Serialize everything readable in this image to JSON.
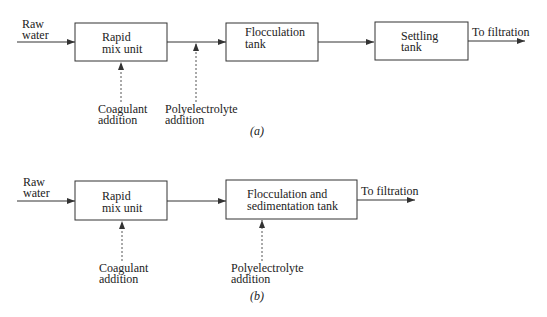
{
  "diagram_a": {
    "input_label": [
      "Raw",
      "water"
    ],
    "boxes": [
      {
        "label": [
          "Rapid",
          "mix unit"
        ]
      },
      {
        "label": [
          "Flocculation",
          "tank"
        ]
      },
      {
        "label": [
          "Settling",
          "tank"
        ]
      }
    ],
    "additions": [
      {
        "label": [
          "Coagulant",
          "addition"
        ]
      },
      {
        "label": [
          "Polyelectrolyte",
          "addition"
        ]
      }
    ],
    "output_label": "To filtration",
    "caption": "(a)"
  },
  "diagram_b": {
    "input_label": [
      "Raw",
      "water"
    ],
    "boxes": [
      {
        "label": [
          "Rapid",
          "mix unit"
        ]
      },
      {
        "label": [
          "Flocculation and",
          "sedimentation tank"
        ]
      }
    ],
    "additions": [
      {
        "label": [
          "Coagulant",
          "addition"
        ]
      },
      {
        "label": [
          "Polyelectrolyte",
          "addition"
        ]
      }
    ],
    "output_label": "To filtration",
    "caption": "(b)"
  },
  "colors": {
    "line": "#333333",
    "text": "#222222",
    "background": "#ffffff"
  }
}
